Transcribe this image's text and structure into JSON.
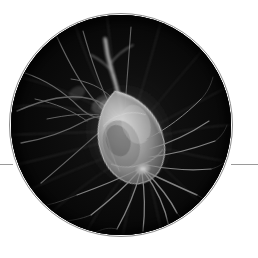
{
  "canvas": {
    "width": 258,
    "height": 258,
    "background_color": "#ffffff"
  },
  "figure": {
    "kind": "circular-photo-medallion",
    "caption_text": "",
    "disc": {
      "center_x": 121,
      "center_y": 125,
      "radius": 110,
      "fill_color": "#050505",
      "ring_color": "#8e8e8e",
      "ring_width_px": 1
    },
    "rules": [
      {
        "name": "left-rule",
        "x": 0,
        "y": 164,
        "width": 13,
        "color": "#9a9a9a"
      },
      {
        "name": "right-rule",
        "x": 231,
        "y": 164,
        "width": 27,
        "color": "#9a9a9a"
      }
    ],
    "image_description": "Grayscale fluorescence micrograph of a single neuron: a bright teardrop-shaped cell body near the center with numerous fine dendrite and axon filaments radiating outward across a black field.",
    "palette": {
      "background": "#050505",
      "soma_bright": "#d8d8d8",
      "soma_mid": "#8e8e8e",
      "filament": "#6e6e6e",
      "filament_faint": "#3a3a3a"
    },
    "soma": {
      "center_x": 128,
      "center_y": 130,
      "width": 62,
      "height": 86,
      "rotation_deg": -18
    }
  }
}
